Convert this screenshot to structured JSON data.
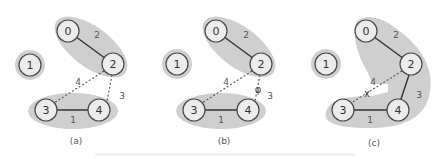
{
  "figure": {
    "panels": [
      {
        "id": "a",
        "caption": "(a)",
        "nodes": [
          {
            "label": "0",
            "x": 68,
            "y": 31
          },
          {
            "label": "1",
            "x": 30,
            "y": 65
          },
          {
            "label": "2",
            "x": 113,
            "y": 64
          },
          {
            "label": "3",
            "x": 46,
            "y": 110
          },
          {
            "label": "4",
            "x": 99,
            "y": 110
          }
        ],
        "edges": [
          {
            "from": "0",
            "to": "2",
            "weight": "2",
            "style": "solid"
          },
          {
            "from": "3",
            "to": "4",
            "weight": "1",
            "style": "solid"
          },
          {
            "from": "2",
            "to": "3",
            "weight": "4",
            "style": "dashed"
          },
          {
            "from": "2",
            "to": "4",
            "weight": "3",
            "style": "dashed"
          }
        ],
        "components": [
          [
            "0",
            "2"
          ],
          [
            "1"
          ],
          [
            "3",
            "4"
          ]
        ]
      },
      {
        "id": "b",
        "caption": "(b)",
        "nodes": [
          {
            "label": "0",
            "x": 216,
            "y": 31
          },
          {
            "label": "1",
            "x": 177,
            "y": 64
          },
          {
            "label": "2",
            "x": 261,
            "y": 64
          },
          {
            "label": "3",
            "x": 194,
            "y": 110
          },
          {
            "label": "4",
            "x": 248,
            "y": 110
          }
        ],
        "edges": [
          {
            "from": "0",
            "to": "2",
            "weight": "2",
            "style": "solid"
          },
          {
            "from": "3",
            "to": "4",
            "weight": "1",
            "style": "solid"
          },
          {
            "from": "2",
            "to": "3",
            "weight": "4",
            "style": "dashed"
          },
          {
            "from": "2",
            "to": "4",
            "weight": "3",
            "style": "dashed",
            "marker": "φ"
          }
        ],
        "components": [
          [
            "0",
            "2"
          ],
          [
            "1"
          ],
          [
            "3",
            "4"
          ]
        ]
      },
      {
        "id": "c",
        "caption": "(c)",
        "nodes": [
          {
            "label": "0",
            "x": 366,
            "y": 31
          },
          {
            "label": "1",
            "x": 326,
            "y": 64
          },
          {
            "label": "2",
            "x": 411,
            "y": 64
          },
          {
            "label": "3",
            "x": 343,
            "y": 110
          },
          {
            "label": "4",
            "x": 398,
            "y": 110
          }
        ],
        "edges": [
          {
            "from": "0",
            "to": "2",
            "weight": "2",
            "style": "solid"
          },
          {
            "from": "3",
            "to": "4",
            "weight": "1",
            "style": "solid"
          },
          {
            "from": "2",
            "to": "4",
            "weight": "3",
            "style": "solid"
          },
          {
            "from": "2",
            "to": "3",
            "weight": "4",
            "style": "dashed",
            "marker": "x"
          }
        ],
        "components": [
          [
            "0",
            "2",
            "3",
            "4"
          ],
          [
            "1"
          ]
        ]
      }
    ]
  },
  "labels": {
    "a": {
      "n0": "0",
      "n1": "1",
      "n2": "2",
      "n3": "3",
      "n4": "4",
      "w02": "2",
      "w34": "1",
      "w23": "4",
      "w24": "3",
      "caption": "(a)"
    },
    "b": {
      "n0": "0",
      "n1": "1",
      "n2": "2",
      "n3": "3",
      "n4": "4",
      "w02": "2",
      "w34": "1",
      "w23": "4",
      "w24": "3",
      "marker": "φ",
      "caption": "(b)"
    },
    "c": {
      "n0": "0",
      "n1": "1",
      "n2": "2",
      "n3": "3",
      "n4": "4",
      "w02": "2",
      "w34": "1",
      "w23": "4",
      "w24": "3",
      "marker": "x",
      "caption": "(c)"
    }
  },
  "colors": {
    "background": "#ffffff",
    "halo": "#cfcfcf",
    "node_fill": "#ececec",
    "node_stroke": "#4a4a4a",
    "edge": "#333333"
  }
}
